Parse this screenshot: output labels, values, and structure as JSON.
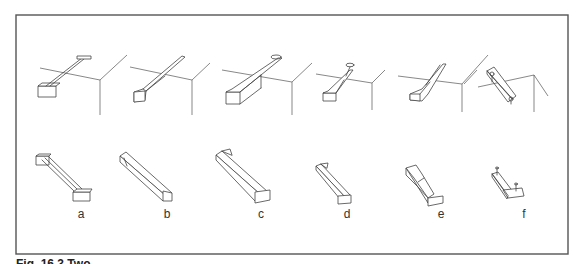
{
  "figure": {
    "panel_labels": [
      "a",
      "b",
      "c",
      "d",
      "e",
      "f"
    ],
    "caption_fragment": "Fig. 16.3  Two..."
  },
  "colors": {
    "line": "#444444",
    "frame": "#555555",
    "background": "#ffffff"
  }
}
